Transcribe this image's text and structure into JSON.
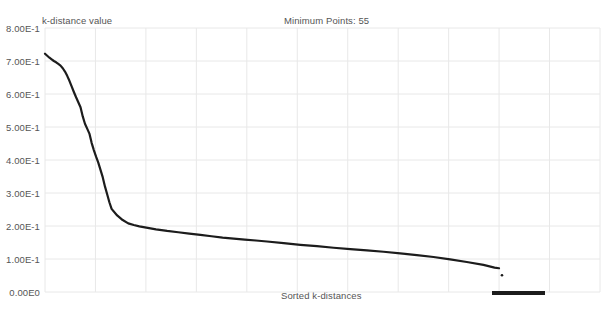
{
  "chart": {
    "title": "Minimum Points: 55",
    "y_axis_name": "k-distance value",
    "x_axis_name": "Sorted k-distances",
    "y_tick_labels": [
      "8.00E-1",
      "7.00E-1",
      "6.00E-1",
      "5.00E-1",
      "4.00E-1",
      "3.00E-1",
      "2.00E-1",
      "1.00E-1",
      "0.00E0"
    ],
    "colors": {
      "series": "#1c1c1c",
      "grid": "#e8e8e8",
      "text": "#555555",
      "background": "#ffffff"
    }
  },
  "chart_data": {
    "type": "line",
    "title": "Minimum Points: 55",
    "xlabel": "Sorted k-distances",
    "ylabel": "k-distance value",
    "ylim": [
      0,
      0.8
    ],
    "xlim": [
      0,
      1
    ],
    "grid": true,
    "legend_position": "none",
    "y_ticks": [
      0.0,
      0.1,
      0.2,
      0.3,
      0.4,
      0.5,
      0.6,
      0.7,
      0.8
    ],
    "y_tick_labels": [
      "0.00E0",
      "1.00E-1",
      "2.00E-1",
      "3.00E-1",
      "4.00E-1",
      "5.00E-1",
      "6.00E-1",
      "7.00E-1",
      "8.00E-1"
    ],
    "x_ticks": [],
    "x_tick_labels": [],
    "series": [
      {
        "name": "k-distance",
        "x": [
          0.0,
          0.004,
          0.008,
          0.012,
          0.016,
          0.02,
          0.024,
          0.028,
          0.032,
          0.036,
          0.04,
          0.044,
          0.048,
          0.052,
          0.056,
          0.06,
          0.064,
          0.068,
          0.072,
          0.076,
          0.08,
          0.084,
          0.088,
          0.092,
          0.096,
          0.1,
          0.104,
          0.108,
          0.112,
          0.116,
          0.12,
          0.13,
          0.14,
          0.15,
          0.16,
          0.17,
          0.18,
          0.19,
          0.2,
          0.22,
          0.24,
          0.26,
          0.28,
          0.3,
          0.32,
          0.34,
          0.36,
          0.38,
          0.4,
          0.43,
          0.46,
          0.49,
          0.52,
          0.55,
          0.58,
          0.61,
          0.64,
          0.67,
          0.7,
          0.73,
          0.76,
          0.79,
          0.81,
          0.818
        ],
        "y": [
          0.722,
          0.716,
          0.71,
          0.705,
          0.7,
          0.696,
          0.691,
          0.686,
          0.678,
          0.668,
          0.655,
          0.64,
          0.623,
          0.606,
          0.59,
          0.575,
          0.56,
          0.532,
          0.51,
          0.495,
          0.48,
          0.452,
          0.43,
          0.41,
          0.392,
          0.37,
          0.348,
          0.32,
          0.296,
          0.272,
          0.252,
          0.232,
          0.218,
          0.208,
          0.203,
          0.199,
          0.196,
          0.193,
          0.19,
          0.185,
          0.181,
          0.177,
          0.173,
          0.169,
          0.165,
          0.162,
          0.159,
          0.156,
          0.153,
          0.148,
          0.143,
          0.139,
          0.134,
          0.13,
          0.126,
          0.122,
          0.117,
          0.112,
          0.106,
          0.099,
          0.091,
          0.082,
          0.074,
          0.072
        ]
      }
    ],
    "annotations": [
      {
        "name": "bottom-marker-bar",
        "x_start": 0.805,
        "x_end": 0.901,
        "y": -0.011
      }
    ]
  }
}
